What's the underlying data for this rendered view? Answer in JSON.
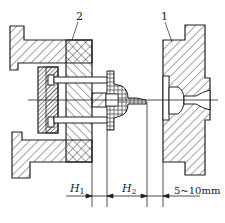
{
  "diagram": {
    "type": "mold ejection cross-section",
    "part_labels": [
      {
        "id": "2",
        "text": "2"
      },
      {
        "id": "1",
        "text": "1"
      }
    ],
    "dimensions": [
      {
        "id": "h1",
        "text": "H",
        "sub": "1"
      },
      {
        "id": "h2",
        "text": "H",
        "sub": "2"
      },
      {
        "id": "gap",
        "text": "5~10mm"
      }
    ],
    "colors": {
      "line": "#222222",
      "hatch": "#333333",
      "background": "#ffffff"
    }
  }
}
